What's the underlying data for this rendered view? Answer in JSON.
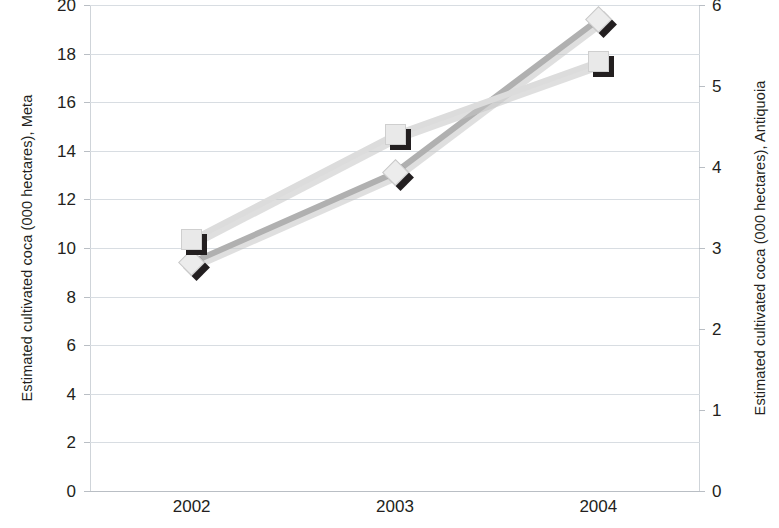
{
  "chart_data": {
    "type": "line",
    "title": "",
    "subtitle": "",
    "xlabel": "",
    "categories": [
      "2002",
      "2003",
      "2004"
    ],
    "grid": true,
    "legend_position": "none",
    "axes": {
      "left": {
        "label": "Estimated cultivated coca (000 hectares), Meta",
        "ticks": [
          "20",
          "18",
          "16",
          "14",
          "12",
          "10",
          "8",
          "6",
          "4",
          "2",
          "0"
        ],
        "tick_values": [
          20,
          18,
          16,
          14,
          12,
          10,
          8,
          6,
          4,
          2,
          0
        ],
        "min": 0,
        "max": 20
      },
      "right": {
        "label": "Estimated cultivated coca (000 hectares), Antiquoia",
        "ticks": [
          "6",
          "5",
          "4",
          "3",
          "2",
          "1",
          "0"
        ],
        "tick_values": [
          6,
          5,
          4,
          3,
          2,
          1,
          0
        ],
        "min": 0,
        "max": 6
      }
    },
    "series": [
      {
        "name": "Meta",
        "axis": "left",
        "marker": "diamond",
        "color": "#b0b0b0",
        "values": [
          9.4,
          13.1,
          19.4
        ]
      },
      {
        "name": "Antiquoia",
        "axis": "right",
        "marker": "square",
        "color": "#dcdcdc",
        "values": [
          3.1,
          4.4,
          5.3
        ]
      }
    ],
    "colors": {
      "gridline": "#d8dde2",
      "axis": "#b9bec4",
      "text": "#231f20",
      "marker_face": "#e9e9e9",
      "marker_shadow": "#231f20",
      "background": "#ffffff"
    }
  }
}
